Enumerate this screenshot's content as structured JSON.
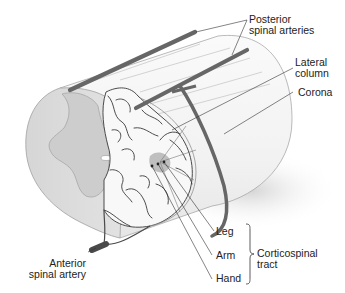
{
  "diagram": {
    "colors": {
      "artery": "#666666",
      "outline": "#9a9a9a",
      "gray_matter": "#c8c8c8",
      "white_matter": "#f4f4f4",
      "vessel": "#3a3a3a",
      "tract_highlight": "#b0b0b0",
      "text": "#222222"
    },
    "labels": {
      "posterior_line1": "Posterior",
      "posterior_line2": "spinal arteries",
      "lateral_line1": "Lateral",
      "lateral_line2": "column",
      "corona": "Corona",
      "leg": "Leg",
      "arm": "Arm",
      "hand": "Hand",
      "cortico_line1": "Corticospinal",
      "cortico_line2": "tract",
      "anterior_line1": "Anterior",
      "anterior_line2": "spinal artery"
    }
  }
}
